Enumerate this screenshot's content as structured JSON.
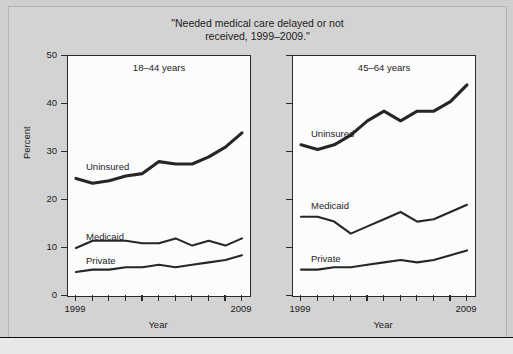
{
  "figure": {
    "title_line1": "\"Needed medical care delayed or not",
    "title_line2": "received, 1999–2009.\"",
    "ylabel": "Percent",
    "xlabel": "Year",
    "x_start_label": "1999",
    "x_end_label": "2009",
    "y_ticks": [
      "0",
      "10",
      "20",
      "30",
      "40",
      "50"
    ],
    "line_color": "#262626",
    "panel_bg": "#fcfcfc",
    "figure_bg": "#d3d3d3"
  },
  "caption": "",
  "chart_data": {
    "type": "line",
    "title": "\"Needed medical care delayed or not received, 1999–2009.\"",
    "xlabel": "Year",
    "ylabel": "Percent",
    "ylim": [
      0,
      50
    ],
    "xlim": [
      1999,
      2009
    ],
    "grid": false,
    "legend": "inline-labels",
    "x": [
      1999,
      2000,
      2001,
      2002,
      2003,
      2004,
      2005,
      2006,
      2007,
      2008,
      2009
    ],
    "panels": [
      {
        "name": "panel-left",
        "title": "18–44 years",
        "series": [
          {
            "name": "Uninsured",
            "values": [
              24.5,
              23.5,
              24.0,
              25.0,
              25.5,
              28.0,
              27.5,
              27.5,
              29.0,
              31.0,
              34.0
            ]
          },
          {
            "name": "Medicaid",
            "values": [
              10.0,
              11.5,
              11.5,
              11.5,
              11.0,
              11.0,
              12.0,
              10.5,
              11.5,
              10.5,
              12.0
            ]
          },
          {
            "name": "Private",
            "values": [
              5.0,
              5.5,
              5.5,
              6.0,
              6.0,
              6.5,
              6.0,
              6.5,
              7.0,
              7.5,
              8.5
            ]
          }
        ]
      },
      {
        "name": "panel-right",
        "title": "45–64 years",
        "series": [
          {
            "name": "Uninsured",
            "values": [
              31.5,
              30.5,
              31.5,
              33.5,
              36.5,
              38.5,
              36.5,
              38.5,
              38.5,
              40.5,
              44.0
            ]
          },
          {
            "name": "Medicaid",
            "values": [
              16.5,
              16.5,
              15.5,
              13.0,
              14.5,
              16.0,
              17.5,
              15.5,
              16.0,
              17.5,
              19.0
            ]
          },
          {
            "name": "Private",
            "values": [
              5.5,
              5.5,
              6.0,
              6.0,
              6.5,
              7.0,
              7.5,
              7.0,
              7.5,
              8.5,
              9.5
            ]
          }
        ]
      }
    ]
  }
}
